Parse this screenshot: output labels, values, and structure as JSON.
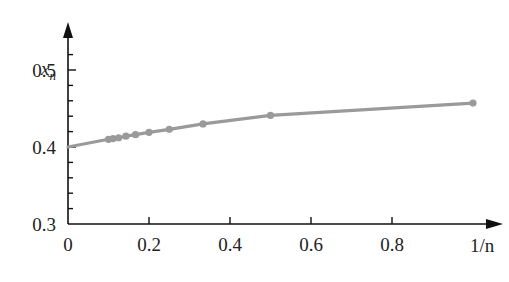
{
  "chart_data": {
    "type": "line",
    "title": "",
    "xlabel": "1/n",
    "ylabel": "x_n",
    "xlim": [
      0,
      1.05
    ],
    "ylim": [
      0.3,
      0.53
    ],
    "x_ticks": [
      0,
      0.2,
      0.4,
      0.6,
      0.8
    ],
    "x_tick_labels": [
      "0",
      "0.2",
      "0.4",
      "0.6",
      "0.8"
    ],
    "y_ticks": [
      0.3,
      0.4,
      0.5
    ],
    "y_tick_labels": [
      "0.3",
      "0.4",
      "0.5"
    ],
    "y_minor_step": 0.02,
    "grid": false,
    "legend": null,
    "series": [
      {
        "name": "x_n vs 1/n",
        "color": "#9a9a9a",
        "marker": "circle",
        "x": [
          1.0,
          0.5,
          0.3333,
          0.25,
          0.2,
          0.1667,
          0.1429,
          0.125,
          0.1111,
          0.1
        ],
        "y": [
          0.457,
          0.441,
          0.43,
          0.423,
          0.419,
          0.416,
          0.414,
          0.412,
          0.411,
          0.41
        ]
      }
    ],
    "curve_intercept": 0.4
  },
  "axes": {
    "x_axis_label": "1/n",
    "y_axis_label_main": "x",
    "y_axis_label_sub": "n"
  }
}
